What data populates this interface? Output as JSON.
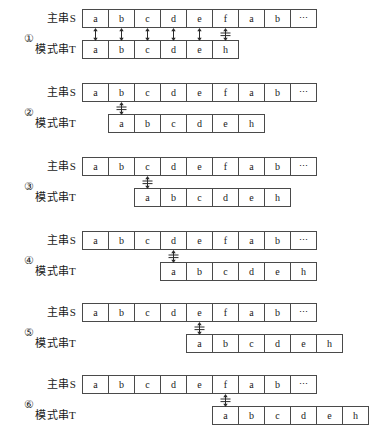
{
  "figure": {
    "label_main": "主串S",
    "label_pattern": "模式串T",
    "ellipsis": "⋯",
    "colors": {
      "background": "#ffffff",
      "border": "#4a4a4a",
      "text": "#1a1a1a"
    },
    "geometry": {
      "cell_width": 26,
      "cell_height": 19,
      "strip_left": 82
    }
  },
  "main_string": {
    "label": "主串S",
    "cells": [
      "a",
      "b",
      "c",
      "d",
      "e",
      "f",
      "a",
      "b",
      "⋯"
    ]
  },
  "pattern_string": {
    "label": "模式串T",
    "cells": [
      "a",
      "b",
      "c",
      "d",
      "e",
      "h"
    ]
  },
  "steps": [
    {
      "index": "①",
      "label_main": "主串S",
      "label_pattern": "模式串T",
      "main_cells": [
        "a",
        "b",
        "c",
        "d",
        "e",
        "f",
        "a",
        "b",
        "⋯"
      ],
      "pattern_cells": [
        "a",
        "b",
        "c",
        "d",
        "e",
        "h"
      ],
      "offset": 0,
      "links": [
        {
          "position": 0,
          "type": "match"
        },
        {
          "position": 1,
          "type": "match"
        },
        {
          "position": 2,
          "type": "match"
        },
        {
          "position": 3,
          "type": "match"
        },
        {
          "position": 4,
          "type": "match"
        },
        {
          "position": 5,
          "type": "mismatch"
        }
      ]
    },
    {
      "index": "②",
      "label_main": "主串S",
      "label_pattern": "模式串T",
      "main_cells": [
        "a",
        "b",
        "c",
        "d",
        "e",
        "f",
        "a",
        "b",
        "⋯"
      ],
      "pattern_cells": [
        "a",
        "b",
        "c",
        "d",
        "e",
        "h"
      ],
      "offset": 1,
      "links": [
        {
          "position": 0,
          "type": "mismatch"
        }
      ]
    },
    {
      "index": "③",
      "label_main": "主串S",
      "label_pattern": "模式串T",
      "main_cells": [
        "a",
        "b",
        "c",
        "d",
        "e",
        "f",
        "a",
        "b",
        "⋯"
      ],
      "pattern_cells": [
        "a",
        "b",
        "c",
        "d",
        "e",
        "h"
      ],
      "offset": 2,
      "links": [
        {
          "position": 0,
          "type": "mismatch"
        }
      ]
    },
    {
      "index": "④",
      "label_main": "主串S",
      "label_pattern": "模式串T",
      "main_cells": [
        "a",
        "b",
        "c",
        "d",
        "e",
        "f",
        "a",
        "b",
        "⋯"
      ],
      "pattern_cells": [
        "a",
        "b",
        "c",
        "d",
        "e",
        "h"
      ],
      "offset": 3,
      "links": [
        {
          "position": 0,
          "type": "mismatch"
        }
      ]
    },
    {
      "index": "⑤",
      "label_main": "主串S",
      "label_pattern": "模式串T",
      "main_cells": [
        "a",
        "b",
        "c",
        "d",
        "e",
        "f",
        "a",
        "b",
        "⋯"
      ],
      "pattern_cells": [
        "a",
        "b",
        "c",
        "d",
        "e",
        "h"
      ],
      "offset": 4,
      "links": [
        {
          "position": 0,
          "type": "mismatch"
        }
      ]
    },
    {
      "index": "⑥",
      "label_main": "主串S",
      "label_pattern": "模式串T",
      "main_cells": [
        "a",
        "b",
        "c",
        "d",
        "e",
        "f",
        "a",
        "b",
        "⋯"
      ],
      "pattern_cells": [
        "a",
        "b",
        "c",
        "d",
        "e",
        "h"
      ],
      "offset": 5,
      "links": [
        {
          "position": 0,
          "type": "mismatch"
        }
      ]
    }
  ]
}
